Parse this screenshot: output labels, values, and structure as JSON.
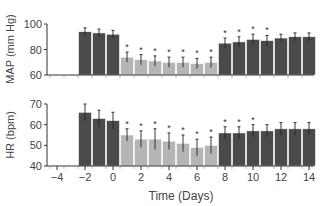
{
  "chart_data": [
    {
      "type": "bar",
      "panel": "top",
      "ylabel": "MAP (mm Hg)",
      "xlabel": "Time (Days)",
      "ylim": [
        60,
        100
      ],
      "yticks": [
        60,
        80,
        100
      ],
      "x": [
        -2,
        -1,
        0,
        1,
        2,
        3,
        4,
        5,
        6,
        7,
        8,
        9,
        10,
        11,
        12,
        13,
        14
      ],
      "values": [
        94,
        93,
        92,
        74,
        72,
        71,
        70,
        70,
        69,
        70,
        85,
        86,
        88,
        87,
        89,
        90,
        90
      ],
      "errors": [
        3,
        3,
        3,
        4,
        4,
        4,
        4,
        4,
        4,
        4,
        4,
        4,
        4,
        4,
        3,
        3,
        3
      ],
      "significant": [
        false,
        false,
        false,
        true,
        true,
        true,
        true,
        true,
        true,
        true,
        true,
        true,
        true,
        true,
        false,
        false,
        false
      ],
      "phase_colors": [
        "dark",
        "dark",
        "dark",
        "light",
        "light",
        "light",
        "light",
        "light",
        "light",
        "light",
        "dark",
        "dark",
        "dark",
        "dark",
        "dark",
        "dark",
        "dark"
      ]
    },
    {
      "type": "bar",
      "panel": "bottom",
      "ylabel": "HR (bpm)",
      "xlabel": "Time (Days)",
      "ylim": [
        40,
        70
      ],
      "yticks": [
        40,
        50,
        60,
        70
      ],
      "x": [
        -2,
        -1,
        0,
        1,
        2,
        3,
        4,
        5,
        6,
        7,
        8,
        9,
        10,
        11,
        12,
        13,
        14
      ],
      "values": [
        66,
        63,
        62,
        55,
        53,
        53,
        52,
        51,
        49,
        50,
        56,
        56,
        57,
        57,
        58,
        58,
        58
      ],
      "errors": [
        4,
        4,
        4,
        3,
        4,
        5,
        4,
        4,
        4,
        4,
        3,
        3,
        3,
        3,
        3,
        3,
        3
      ],
      "significant": [
        false,
        false,
        false,
        true,
        true,
        true,
        true,
        true,
        true,
        true,
        true,
        true,
        true,
        false,
        false,
        false,
        false
      ],
      "phase_colors": [
        "dark",
        "dark",
        "dark",
        "light",
        "light",
        "light",
        "light",
        "light",
        "light",
        "light",
        "dark",
        "dark",
        "dark",
        "dark",
        "dark",
        "dark",
        "dark"
      ]
    }
  ],
  "xticks": [
    -4,
    -2,
    0,
    2,
    4,
    6,
    8,
    10,
    12,
    14
  ],
  "xlabel": "Time (Days)",
  "colors": {
    "dark": "#4a4a4a",
    "light": "#b5b5b5",
    "axis": "#333333"
  }
}
